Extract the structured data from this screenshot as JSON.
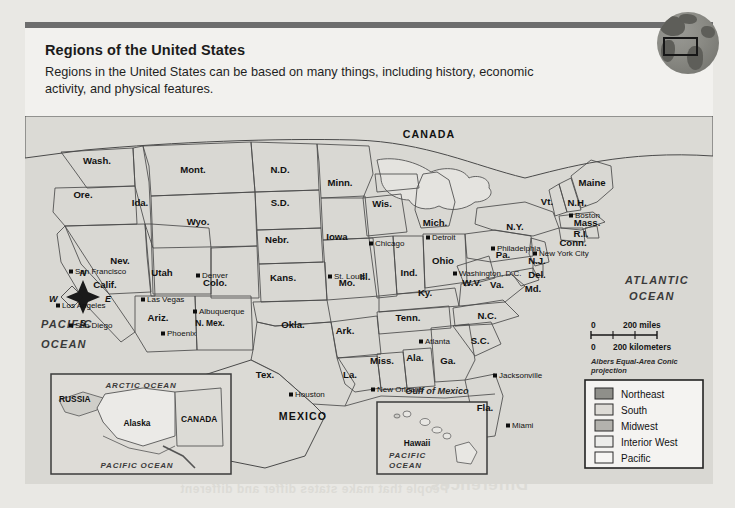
{
  "page": {
    "title": "Regions of the United States",
    "description": "Regions in the United States can be based on many things, including history, economic activity, and physical features."
  },
  "globe_icon": "globe-with-highlight-rectangle",
  "map": {
    "countries": [
      "CANADA",
      "MEXICO"
    ],
    "oceans": [
      "ATLANTIC OCEAN",
      "PACIFIC OCEAN"
    ],
    "water_bodies": [
      "Gulf of Mexico"
    ],
    "compass": {
      "north": "N",
      "south": "S",
      "east": "E",
      "west": "W"
    },
    "scale": {
      "miles_zero": "0",
      "miles_label": "200 miles",
      "km_zero": "0",
      "km_label": "200 kilometers",
      "projection": "Albers Equal-Area Conic projection"
    },
    "legend": {
      "items": [
        {
          "label": "Northeast",
          "color": "#8f8f8a"
        },
        {
          "label": "South",
          "color": "#dddbd6"
        },
        {
          "label": "Midwest",
          "color": "#b3b2ad"
        },
        {
          "label": "Interior West",
          "color": "#ececea"
        },
        {
          "label": "Pacific",
          "color": "#f6f5f3"
        }
      ]
    },
    "insets": [
      {
        "name": "alaska-inset",
        "labels": [
          "ARCTIC OCEAN",
          "RUSSIA",
          "CANADA",
          "Alaska",
          "PACIFIC OCEAN"
        ]
      },
      {
        "name": "hawaii-inset",
        "labels": [
          "Hawaii",
          "PACIFIC OCEAN"
        ]
      }
    ],
    "states": [
      {
        "label": "Wash.",
        "x": 72,
        "y": 48,
        "region": "Pacific"
      },
      {
        "label": "Ore.",
        "x": 58,
        "y": 82,
        "region": "Pacific"
      },
      {
        "label": "Ida.",
        "x": 115,
        "y": 90,
        "region": "Interior West"
      },
      {
        "label": "Mont.",
        "x": 168,
        "y": 57,
        "region": "Interior West"
      },
      {
        "label": "Wyo.",
        "x": 173,
        "y": 109,
        "region": "Interior West"
      },
      {
        "label": "N.D.",
        "x": 255,
        "y": 57,
        "region": "Midwest"
      },
      {
        "label": "S.D.",
        "x": 255,
        "y": 90,
        "region": "Midwest"
      },
      {
        "label": "Nebr.",
        "x": 252,
        "y": 127,
        "region": "Midwest"
      },
      {
        "label": "Minn.",
        "x": 315,
        "y": 70,
        "region": "Midwest"
      },
      {
        "label": "Wis.",
        "x": 357,
        "y": 91,
        "region": "Midwest"
      },
      {
        "label": "Iowa",
        "x": 312,
        "y": 124,
        "region": "Midwest"
      },
      {
        "label": "Ill.",
        "x": 340,
        "y": 164,
        "region": "Midwest"
      },
      {
        "label": "Mich.",
        "x": 410,
        "y": 110,
        "region": "Midwest"
      },
      {
        "label": "Ind.",
        "x": 384,
        "y": 160,
        "region": "Midwest"
      },
      {
        "label": "Ohio",
        "x": 418,
        "y": 148,
        "region": "Midwest"
      },
      {
        "label": "Mo.",
        "x": 322,
        "y": 170,
        "region": "Midwest"
      },
      {
        "label": "Kans.",
        "x": 258,
        "y": 165,
        "region": "Midwest"
      },
      {
        "label": "Nev.",
        "x": 95,
        "y": 148,
        "region": "Pacific"
      },
      {
        "label": "Calif.",
        "x": 80,
        "y": 172,
        "region": "Pacific"
      },
      {
        "label": "Utah",
        "x": 137,
        "y": 160,
        "region": "Interior West"
      },
      {
        "label": "Colo.",
        "x": 190,
        "y": 170,
        "region": "Interior West"
      },
      {
        "label": "Ariz.",
        "x": 133,
        "y": 205,
        "region": "Interior West"
      },
      {
        "label": "N. Mex.",
        "x": 185,
        "y": 210,
        "region": "Interior West"
      },
      {
        "label": "Okla.",
        "x": 268,
        "y": 212,
        "region": "South"
      },
      {
        "label": "Tex.",
        "x": 240,
        "y": 262,
        "region": "South"
      },
      {
        "label": "Ark.",
        "x": 320,
        "y": 218,
        "region": "South"
      },
      {
        "label": "La.",
        "x": 325,
        "y": 262,
        "region": "South"
      },
      {
        "label": "Miss.",
        "x": 357,
        "y": 248,
        "region": "South"
      },
      {
        "label": "Ala.",
        "x": 390,
        "y": 245,
        "region": "South"
      },
      {
        "label": "Tenn.",
        "x": 383,
        "y": 205,
        "region": "South"
      },
      {
        "label": "Ky.",
        "x": 400,
        "y": 180,
        "region": "South"
      },
      {
        "label": "Ga.",
        "x": 423,
        "y": 248,
        "region": "South"
      },
      {
        "label": "Fla.",
        "x": 460,
        "y": 295,
        "region": "South"
      },
      {
        "label": "S.C.",
        "x": 455,
        "y": 228,
        "region": "South"
      },
      {
        "label": "N.C.",
        "x": 462,
        "y": 203,
        "region": "South"
      },
      {
        "label": "Va.",
        "x": 472,
        "y": 172,
        "region": "South"
      },
      {
        "label": "W.V.",
        "x": 447,
        "y": 170,
        "region": "South"
      },
      {
        "label": "Md.",
        "x": 508,
        "y": 176,
        "region": "South"
      },
      {
        "label": "Del.",
        "x": 512,
        "y": 162,
        "region": "Northeast"
      },
      {
        "label": "N.J.",
        "x": 512,
        "y": 148,
        "region": "Northeast"
      },
      {
        "label": "Pa.",
        "x": 478,
        "y": 142,
        "region": "Northeast"
      },
      {
        "label": "N.Y.",
        "x": 490,
        "y": 114,
        "region": "Northeast"
      },
      {
        "label": "Vt.",
        "x": 522,
        "y": 89,
        "region": "Northeast"
      },
      {
        "label": "N.H.",
        "x": 552,
        "y": 90,
        "region": "Northeast"
      },
      {
        "label": "Maine",
        "x": 567,
        "y": 70,
        "region": "Northeast"
      },
      {
        "label": "Mass.",
        "x": 562,
        "y": 110,
        "region": "Northeast"
      },
      {
        "label": "R.I.",
        "x": 556,
        "y": 121,
        "region": "Northeast"
      },
      {
        "label": "Conn.",
        "x": 548,
        "y": 130,
        "region": "Northeast"
      }
    ],
    "cities": [
      {
        "label": "San Francisco",
        "x": 48,
        "y": 158,
        "anchor": "start"
      },
      {
        "label": "Los Angeles",
        "x": 35,
        "y": 192,
        "anchor": "start"
      },
      {
        "label": "San Diego",
        "x": 48,
        "y": 212,
        "anchor": "start"
      },
      {
        "label": "Las Vegas",
        "x": 120,
        "y": 186,
        "anchor": "start"
      },
      {
        "label": "Phoenix",
        "x": 140,
        "y": 220,
        "anchor": "start"
      },
      {
        "label": "Albuquerque",
        "x": 172,
        "y": 198,
        "anchor": "start"
      },
      {
        "label": "Denver",
        "x": 175,
        "y": 162,
        "anchor": "start"
      },
      {
        "label": "St. Louis",
        "x": 307,
        "y": 163,
        "anchor": "start"
      },
      {
        "label": "Chicago",
        "x": 348,
        "y": 130,
        "anchor": "start"
      },
      {
        "label": "Detroit",
        "x": 405,
        "y": 124,
        "anchor": "start"
      },
      {
        "label": "Houston",
        "x": 268,
        "y": 281,
        "anchor": "start"
      },
      {
        "label": "New Orleans",
        "x": 350,
        "y": 276,
        "anchor": "start"
      },
      {
        "label": "Atlanta",
        "x": 398,
        "y": 228,
        "anchor": "start"
      },
      {
        "label": "Jacksonville",
        "x": 472,
        "y": 262,
        "anchor": "start"
      },
      {
        "label": "Miami",
        "x": 485,
        "y": 312,
        "anchor": "start"
      },
      {
        "label": "Washington, D.C.",
        "x": 432,
        "y": 160,
        "anchor": "start"
      },
      {
        "label": "Philadelphia",
        "x": 470,
        "y": 135,
        "anchor": "start"
      },
      {
        "label": "New York City",
        "x": 512,
        "y": 140,
        "anchor": "start"
      },
      {
        "label": "Boston",
        "x": 548,
        "y": 102,
        "anchor": "start"
      }
    ]
  },
  "bleed_text": {
    "a": "Ahead",
    "b": "how a place's outdoor",
    "c": "how a place's location",
    "d": "region change",
    "e": "Differences",
    "f": "People that make states differ and different"
  }
}
